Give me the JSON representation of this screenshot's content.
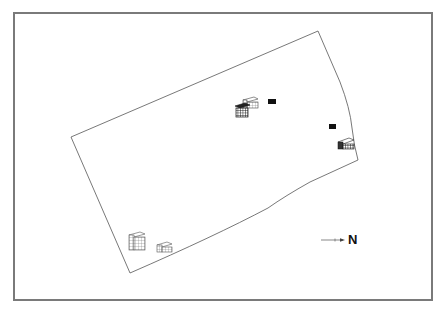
{
  "map": {
    "type": "site-plan",
    "frame_color": "#7a7a7a",
    "line_color": "#555555",
    "site_boundary": {
      "vertices": [
        [
          318,
          31
        ],
        [
          350,
          110
        ],
        [
          358,
          160
        ],
        [
          268,
          208
        ],
        [
          130,
          273
        ],
        [
          71,
          137
        ]
      ]
    },
    "buildings": [
      {
        "id": "cluster-light-box",
        "style": "wireframe-light",
        "x": 243,
        "y": 97,
        "w": 15,
        "h": 9
      },
      {
        "id": "cluster-dark-grid",
        "style": "wireframe-dark",
        "x": 235,
        "y": 103,
        "w": 15,
        "h": 14
      },
      {
        "id": "black-marker-1",
        "style": "solid",
        "x": 268,
        "y": 99,
        "w": 8,
        "h": 5
      },
      {
        "id": "black-marker-2",
        "style": "solid",
        "x": 329,
        "y": 124,
        "w": 7,
        "h": 5
      },
      {
        "id": "east-building",
        "style": "wireframe-dark",
        "x": 338,
        "y": 137,
        "w": 16,
        "h": 12
      },
      {
        "id": "southwest-tall-building",
        "style": "wireframe-light",
        "x": 129,
        "y": 232,
        "w": 16,
        "h": 18
      },
      {
        "id": "southwest-small-building",
        "style": "wireframe-light",
        "x": 157,
        "y": 242,
        "w": 15,
        "h": 10
      }
    ],
    "north_arrow": {
      "label": "N",
      "x1": 321,
      "y1": 240,
      "x2": 344,
      "y2": 240
    }
  }
}
